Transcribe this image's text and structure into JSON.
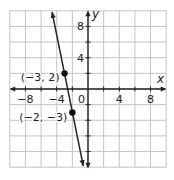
{
  "chart_data": {
    "type": "line",
    "title": "",
    "xlabel": "x",
    "ylabel": "y",
    "xlim": [
      -10,
      10
    ],
    "ylim": [
      -10,
      10
    ],
    "grid": true,
    "grid_step": 2,
    "x_ticks": [
      -8,
      -4,
      0,
      4,
      8
    ],
    "y_ticks": [
      4,
      8
    ],
    "x_tick_labels": [
      "−8",
      "−4",
      "4",
      "8"
    ],
    "y_tick_labels": [
      "8",
      "4"
    ],
    "origin_label": "0",
    "series": [
      {
        "name": "line",
        "equation": "y = -5x - 13",
        "x": [
          -4.6,
          -0.6
        ],
        "y": [
          10,
          -10
        ],
        "arrows": "both"
      }
    ],
    "points": [
      {
        "x": -3,
        "y": 2,
        "label": "(−3, 2)"
      },
      {
        "x": -2,
        "y": -3,
        "label": "(−2, −3)"
      }
    ],
    "colors": {
      "grid": "#bdbdbd",
      "axis": "#222222",
      "line": "#222222",
      "point": "#111111"
    }
  }
}
